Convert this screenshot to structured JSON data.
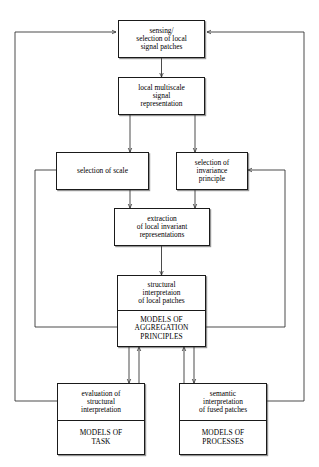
{
  "diagram": {
    "type": "flowchart",
    "line_color": "#2b2b2b",
    "box_fill": "#ffffff",
    "nodes": [
      {
        "id": "sensing",
        "lines": [
          "sensing/",
          "selection of local",
          "signal patches"
        ]
      },
      {
        "id": "multiscale",
        "lines": [
          "local multiscale",
          "signal",
          "representation"
        ]
      },
      {
        "id": "scale",
        "lines": [
          "selection of scale"
        ]
      },
      {
        "id": "invariance",
        "lines": [
          "selection of",
          "invariance",
          "principle"
        ]
      },
      {
        "id": "extraction",
        "lines": [
          "extraction",
          "of local invariant",
          "representations"
        ]
      },
      {
        "id": "structural",
        "lines": [
          "structural",
          "interpretaion",
          "of local patches"
        ]
      },
      {
        "id": "aggregation",
        "lines": [
          "MODELS OF",
          "AGGREGATION",
          "PRINCIPLES"
        ]
      },
      {
        "id": "evaluation",
        "lines": [
          "evaluation of",
          "structural",
          "interpretation"
        ]
      },
      {
        "id": "models_task",
        "lines": [
          "MODELS OF",
          "TASK"
        ]
      },
      {
        "id": "semantic",
        "lines": [
          "semantic",
          "interpretation",
          "of fused patches"
        ]
      },
      {
        "id": "models_processes",
        "lines": [
          "MODELS OF",
          "PROCESSES"
        ]
      }
    ]
  }
}
